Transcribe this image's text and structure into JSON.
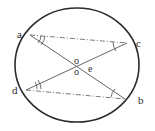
{
  "figure": {
    "kind": "circle-geometry-diagram",
    "width": 155,
    "height": 131,
    "background_color": "#ffffff",
    "stroke_color": "#2b2b2b",
    "chord_color": "#555555",
    "dashdot_color": "#6b6b6b"
  },
  "circle": {
    "name": "circle-outline",
    "center_x": 77,
    "center_y": 65,
    "radius_x": 62,
    "radius_y": 57,
    "stroke_width": 1.6
  },
  "points": [
    {
      "id": "a",
      "label": "a",
      "label_x": 17,
      "label_y": 29,
      "point_x": 30,
      "point_y": 35
    },
    {
      "id": "c",
      "label": "c",
      "label_x": 136,
      "label_y": 38,
      "point_x": 127,
      "point_y": 43
    },
    {
      "id": "d",
      "label": "d",
      "label_x": 12,
      "label_y": 85,
      "point_x": 26,
      "point_y": 90
    },
    {
      "id": "b",
      "label": "b",
      "label_x": 138,
      "label_y": 95,
      "point_x": 125,
      "point_y": 99
    }
  ],
  "center_labels": [
    {
      "id": "o-upper",
      "label": "o",
      "x": 74,
      "y": 56
    },
    {
      "id": "o-lower",
      "label": "o",
      "x": 74,
      "y": 67
    },
    {
      "id": "e",
      "label": "e",
      "x": 88,
      "y": 64
    }
  ],
  "chords": [
    {
      "id": "a-b",
      "from": "a",
      "to": "b",
      "style": "solid"
    },
    {
      "id": "d-c",
      "from": "d",
      "to": "c",
      "style": "solid"
    }
  ],
  "dashdot_lines": [
    {
      "id": "a-c",
      "from": "a",
      "to": "c",
      "style": "dash-dot"
    },
    {
      "id": "d-b",
      "from": "d",
      "to": "b",
      "style": "dash-dot"
    }
  ],
  "angle_marks": [
    {
      "id": "angle-a",
      "at": "a",
      "arcs": 2
    },
    {
      "id": "angle-d",
      "at": "d",
      "arcs": 2
    },
    {
      "id": "angle-c",
      "at": "c",
      "arcs": 1
    },
    {
      "id": "angle-b",
      "at": "b",
      "arcs": 1
    }
  ]
}
